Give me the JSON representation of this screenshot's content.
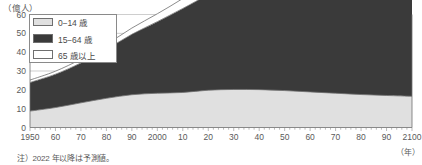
{
  "chart_data": {
    "type": "area",
    "stacked": true,
    "title": "",
    "subtitle": "",
    "xlabel": "年",
    "ylabel": "億人",
    "unit_label": "（億人）",
    "x_unit_label": "（年）",
    "xlim": [
      1950,
      2100
    ],
    "ylim": [
      0,
      60
    ],
    "ytick_step": 10,
    "xtick_step": 10,
    "grid": true,
    "grid_axis": "y",
    "legend_position": "top-left",
    "x": [
      1950,
      1960,
      1970,
      1980,
      1990,
      2000,
      2010,
      2020,
      2030,
      2040,
      2050,
      2060,
      2070,
      2080,
      2090,
      2100
    ],
    "xtick_labels": [
      "1950",
      "60",
      "70",
      "80",
      "90",
      "2000",
      "10",
      "20",
      "30",
      "40",
      "50",
      "60",
      "70",
      "80",
      "90",
      "2100"
    ],
    "ytick_labels": [
      "0",
      "10",
      "20",
      "30",
      "40",
      "50",
      "60"
    ],
    "ytick_values": [
      0,
      10,
      20,
      30,
      40,
      50,
      60
    ],
    "series": [
      {
        "name": "0−14 歳",
        "color": "#e0e0e0",
        "values": [
          8.7,
          10.6,
          13.1,
          15.5,
          17.4,
          18.2,
          18.6,
          19.8,
          20.2,
          20.1,
          19.6,
          18.9,
          18.2,
          17.5,
          17.0,
          16.6
        ]
      },
      {
        "name": "15−64 歳",
        "color": "#3a3a3a",
        "values": [
          15.2,
          17.7,
          21.2,
          26.0,
          32.1,
          38.0,
          44.6,
          50.6,
          55.7,
          59.8,
          62.5,
          63.8,
          64.0,
          63.2,
          61.6,
          59.6
        ]
      },
      {
        "name": "65 歳以上",
        "color": "#ffffff",
        "values": [
          1.3,
          1.6,
          2.0,
          2.6,
          3.3,
          4.2,
          5.3,
          7.3,
          9.9,
          13.0,
          16.0,
          18.7,
          20.8,
          22.3,
          23.4,
          24.0
        ]
      }
    ],
    "totals": [
      25.2,
      29.9,
      36.3,
      44.1,
      52.8,
      60.4,
      68.5,
      77.7,
      85.8,
      92.9,
      98.1,
      101.4,
      103.0,
      103.0,
      102.0,
      100.2
    ],
    "annotations": [
      "注）2022 年以降は予測値。"
    ]
  },
  "legend": {
    "items": [
      {
        "label": "0−14 歳",
        "swatch": "light-gray"
      },
      {
        "label": "15−64 歳",
        "swatch": "dark-gray"
      },
      {
        "label": "65 歳以上",
        "swatch": "white"
      }
    ]
  },
  "note": {
    "text": "注）2022 年以降は予測値。"
  },
  "axes": {
    "y_unit": "（億人）",
    "x_unit": "（年）"
  },
  "colors": {
    "young": "#e0e0e0",
    "working": "#3a3a3a",
    "elderly": "#ffffff",
    "axis": "#6f6f6f",
    "grid": "#b9b9b9",
    "text": "#5a5a5a"
  }
}
